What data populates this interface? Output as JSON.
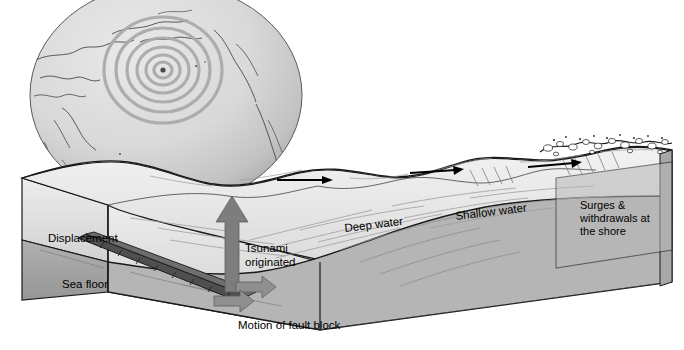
{
  "figure": {
    "kind": "scientific-cross-section-diagram",
    "background_color": "#ffffff",
    "width": 684,
    "height": 350
  },
  "globe": {
    "name": "pacific-ocean-globe",
    "center_x": 166,
    "center_y": 95,
    "radius_x": 136,
    "radius_y": 112,
    "fill": "#d6d6d6",
    "outline": "#555555",
    "epicenter": {
      "label": "epicenter",
      "x": 163,
      "y": 70,
      "dot_color": "#4a4a4a"
    },
    "wave_rings": {
      "count": 6,
      "color": "#a9a9a9",
      "radii": [
        9,
        17,
        26,
        36,
        47,
        59
      ]
    },
    "coastline_color": "#4a4a4a"
  },
  "block": {
    "name": "ocean-block-cutaway",
    "water_fill": "#e8e8e8",
    "water_side_fill": "#dcdcdc",
    "crust_fill": "#b5b5b5",
    "crust_side_fill": "#9e9e9e",
    "outline": "#1a1a1a",
    "right_face_fill": "#b8b8b8"
  },
  "labels": {
    "displacement": "Displacement",
    "sea_floor": "Sea floor",
    "tsunami_originated_line1": "Tsunami",
    "tsunami_originated_line2": "originated",
    "deep_water": "Deep water",
    "shallow_water": "Shallow water",
    "surges_line1": "Surges &",
    "surges_line2": "withdrawals at",
    "surges_line3": "the shore",
    "motion_of_fault_block": "Motion of fault block"
  },
  "arrows": {
    "uplift_arrow": {
      "name": "tsunami-uplift-arrow",
      "color": "#7d7d7d",
      "direction": "up",
      "x": 232,
      "y_top": 198,
      "y_bottom": 292
    },
    "propagation_arrows": [
      {
        "name": "wave-direction-arrow-1",
        "x1": 277,
        "y1": 180,
        "x2": 331,
        "y2": 180,
        "color": "#000000"
      },
      {
        "name": "wave-direction-arrow-2",
        "x1": 410,
        "y1": 172,
        "x2": 462,
        "y2": 170,
        "color": "#000000"
      },
      {
        "name": "wave-direction-arrow-3",
        "x1": 528,
        "y1": 166,
        "x2": 586,
        "y2": 163,
        "color": "#000000"
      }
    ],
    "fault_motion_arrows": [
      {
        "name": "fault-block-up-arrow",
        "color": "#8a8a8a"
      },
      {
        "name": "fault-block-down-arrow",
        "color": "#8a8a8a"
      }
    ]
  },
  "features": {
    "fault_scarp": {
      "name": "fault-scarp",
      "fill": "#4f4f4f",
      "hatch": "#2a2a2a"
    },
    "breaking_waves": {
      "name": "breaking-wave-foam",
      "fill": "#ffffff",
      "outline": "#1a1a1a"
    }
  }
}
